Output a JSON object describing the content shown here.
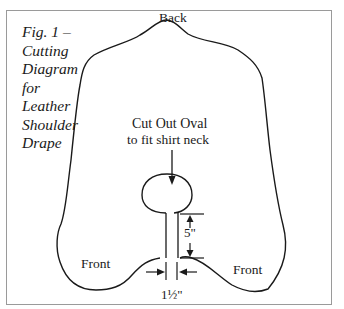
{
  "figure": {
    "caption_lines": [
      "Fig. 1 –",
      "Cutting",
      "Diagram",
      "for",
      "Leather",
      "Shoulder",
      "Drape"
    ]
  },
  "labels": {
    "back": "Back",
    "cut_line1": "Cut Out Oval",
    "cut_line2": "to fit shirt neck",
    "front_left": "Front",
    "front_right": "Front",
    "slit_length": "5\"",
    "slit_width": "1½\""
  },
  "colors": {
    "line": "#1a1a1a",
    "frame": "#9a9a9a",
    "background": "#ffffff"
  }
}
